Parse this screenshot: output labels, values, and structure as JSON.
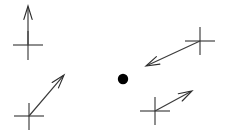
{
  "figure": {
    "title": "",
    "background_color": "#ffffff",
    "width": 229,
    "height": 140,
    "stroke_color": "#3c3c3c",
    "cross_color": "#4a4a4a",
    "marker_color": "#000000"
  },
  "chart_data": {
    "type": "scatter",
    "title": "",
    "subtitle": "",
    "xlabel": "",
    "ylabel": "",
    "grid": false,
    "legend": null,
    "xlim": [
      0,
      229
    ],
    "ylim": [
      0,
      140
    ],
    "center_marker": {
      "label": "center-dot",
      "x": 123,
      "y": 79,
      "radius": 5.2,
      "filled": true,
      "color": "#000000"
    },
    "series": [
      {
        "name": "vector-markers",
        "values": [
          {
            "id": "marker-top-left",
            "cross_x": 28,
            "cross_y": 45,
            "cross_arm_h": 15,
            "cross_arm_v_up": 14,
            "cross_arm_v_down": 15,
            "arrow_from_x": 28,
            "arrow_from_y": 45,
            "arrow_to_x": 28,
            "arrow_to_y": 6,
            "direction_deg": 90,
            "length_px": 39
          },
          {
            "id": "marker-bottom-left",
            "cross_x": 29,
            "cross_y": 116,
            "cross_arm_h": 15,
            "cross_arm_v_up": 13,
            "cross_arm_v_down": 14,
            "arrow_from_x": 29,
            "arrow_from_y": 116,
            "arrow_to_x": 64,
            "arrow_to_y": 75,
            "direction_deg": 49.5,
            "length_px": 54
          },
          {
            "id": "marker-top-right",
            "cross_x": 200,
            "cross_y": 41,
            "cross_arm_h": 15,
            "cross_arm_v_up": 14,
            "cross_arm_v_down": 14,
            "arrow_from_x": 200,
            "arrow_from_y": 41,
            "arrow_to_x": 146,
            "arrow_to_y": 66,
            "direction_deg": 204.8,
            "length_px": 59
          },
          {
            "id": "marker-bottom-right",
            "cross_x": 155,
            "cross_y": 111,
            "cross_arm_h": 15,
            "cross_arm_v_up": 14,
            "cross_arm_v_down": 14,
            "arrow_from_x": 155,
            "arrow_from_y": 111,
            "arrow_to_x": 192,
            "arrow_to_y": 91,
            "direction_deg": 28.4,
            "length_px": 42
          }
        ]
      }
    ]
  },
  "labels": {
    "top_left": "",
    "top_right": "",
    "bottom_left": "",
    "bottom_right": "",
    "center": ""
  },
  "icons": {
    "cross": "cross-marker-icon",
    "arrow": "vector-arrow-icon",
    "dot": "filled-dot-icon"
  }
}
